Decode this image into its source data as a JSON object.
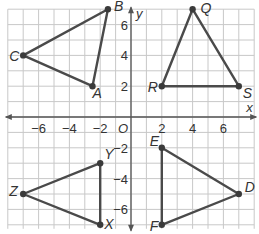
{
  "graph": {
    "x_range": [
      -8,
      8
    ],
    "y_range": [
      -7,
      7
    ],
    "axis_labels": {
      "x": "x",
      "y": "y",
      "origin": "O"
    },
    "x_ticks": [
      {
        "value": -6,
        "label": "−6"
      },
      {
        "value": -4,
        "label": "−4"
      },
      {
        "value": -2,
        "label": "−2"
      },
      {
        "value": 2,
        "label": "2"
      },
      {
        "value": 4,
        "label": "4"
      },
      {
        "value": 6,
        "label": "6"
      }
    ],
    "y_ticks": [
      {
        "value": 6,
        "label": "6"
      },
      {
        "value": 4,
        "label": "4"
      },
      {
        "value": 2,
        "label": "2"
      },
      {
        "value": -2,
        "label": "−2"
      },
      {
        "value": -4,
        "label": "−4"
      },
      {
        "value": -6,
        "label": "−6"
      }
    ],
    "triangles": [
      {
        "name": "ABC",
        "vertices": [
          {
            "label": "A",
            "x": -2.5,
            "y": 2
          },
          {
            "label": "B",
            "x": -1.5,
            "y": 7
          },
          {
            "label": "C",
            "x": -7,
            "y": 4
          }
        ]
      },
      {
        "name": "QRS",
        "vertices": [
          {
            "label": "Q",
            "x": 4,
            "y": 7
          },
          {
            "label": "R",
            "x": 2,
            "y": 2
          },
          {
            "label": "S",
            "x": 7,
            "y": 2
          }
        ]
      },
      {
        "name": "XYZ",
        "vertices": [
          {
            "label": "X",
            "x": -2,
            "y": -7
          },
          {
            "label": "Y",
            "x": -2,
            "y": -3
          },
          {
            "label": "Z",
            "x": -7,
            "y": -5
          }
        ]
      },
      {
        "name": "DEF",
        "vertices": [
          {
            "label": "D",
            "x": 7,
            "y": -5
          },
          {
            "label": "E",
            "x": 2,
            "y": -2
          },
          {
            "label": "F",
            "x": 2,
            "y": -7
          }
        ]
      }
    ]
  }
}
